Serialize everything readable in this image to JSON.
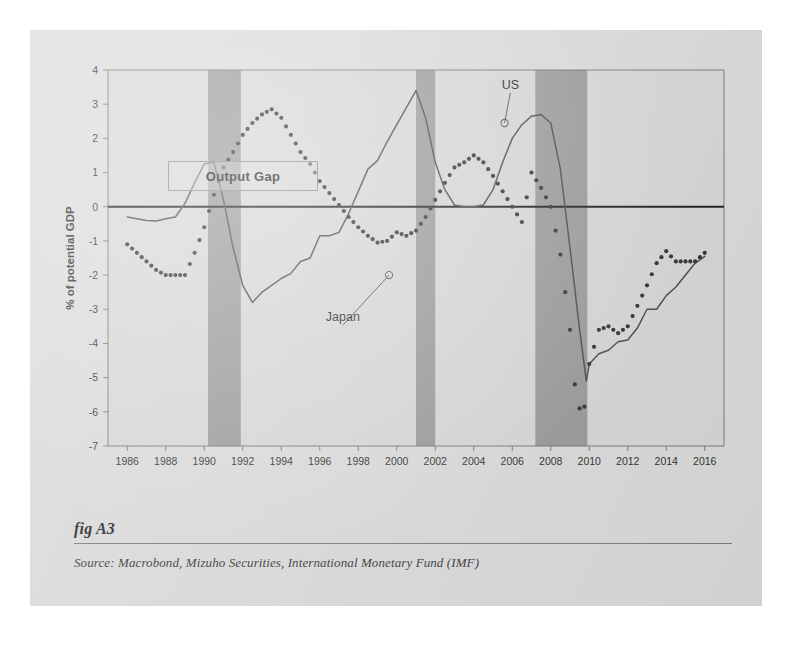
{
  "figure": {
    "label": "fig A3",
    "source": "Source:  Macrobond, Mizuho Securities, International Monetary Fund (IMF)"
  },
  "colors": {
    "page_background": "#ffffff",
    "card_background": "#dcdcdc",
    "plot_background": "#d8d8d8",
    "recession_band": "#9a9a9a",
    "series_line": "#4a4a4a",
    "zero_line": "#1a1a1a",
    "axis": "#6f6f6f",
    "text": "#2a2a2a"
  },
  "chart_data": {
    "type": "line",
    "title": "Output Gap",
    "xlabel": "",
    "ylabel": "% of potential GDP",
    "xlim": [
      1985,
      2017
    ],
    "ylim": [
      -7,
      4
    ],
    "yticks": [
      4,
      3,
      2,
      1,
      0,
      -1,
      -2,
      -3,
      -4,
      -5,
      -6,
      -7
    ],
    "ytick_labels": [
      "4",
      "3",
      "2",
      "1",
      "0",
      "-1",
      "-2",
      "-3",
      "-4",
      "-5",
      "-6",
      "-7"
    ],
    "xticks": [
      1986,
      1988,
      1990,
      1992,
      1994,
      1996,
      1998,
      2000,
      2002,
      2004,
      2006,
      2008,
      2010,
      2012,
      2014,
      2016
    ],
    "xtick_labels": [
      "1986",
      "1988",
      "1990",
      "1992",
      "1994",
      "1996",
      "1998",
      "2000",
      "2002",
      "2004",
      "2006",
      "2008",
      "2010",
      "2012",
      "2014",
      "2016"
    ],
    "grid": false,
    "zero_line": 0,
    "legend_position": "inline-annotations",
    "shaded_regions": [
      {
        "name": "recession-band-1990",
        "start": 1990.2,
        "end": 1991.9
      },
      {
        "name": "recession-band-2001",
        "start": 2001.0,
        "end": 2002.0
      },
      {
        "name": "recession-band-2008",
        "start": 2007.2,
        "end": 2009.9
      }
    ],
    "annotations": [
      {
        "name": "US",
        "text": "US",
        "series": "US",
        "point_x": 2005.6,
        "point_y": 2.45,
        "label_x": 2005.9,
        "label_y": 3.45
      },
      {
        "name": "Japan",
        "text": "Japan",
        "series": "Japan",
        "point_x": 1999.6,
        "point_y": -2.0,
        "label_x": 1997.2,
        "label_y": -3.35
      }
    ],
    "x": [
      1986,
      1986.5,
      1987,
      1987.5,
      1988,
      1988.5,
      1989,
      1989.5,
      1990,
      1990.5,
      1991,
      1991.5,
      1992,
      1992.5,
      1993,
      1993.5,
      1994,
      1994.5,
      1995,
      1995.5,
      1996,
      1996.5,
      1997,
      1997.5,
      1998,
      1998.5,
      1999,
      1999.5,
      2000,
      2000.5,
      2001,
      2001.5,
      2002,
      2002.5,
      2003,
      2003.5,
      2004,
      2004.5,
      2005,
      2005.5,
      2006,
      2006.5,
      2007,
      2007.5,
      2008,
      2008.5,
      2009,
      2009.5,
      2010,
      2010.5,
      2011,
      2011.5,
      2012,
      2012.5,
      2013,
      2013.5,
      2014,
      2014.5,
      2015,
      2015.5,
      2016
    ],
    "series": [
      {
        "name": "US",
        "style": "solid",
        "values": [
          -0.3,
          -0.35,
          -0.4,
          -0.42,
          -0.35,
          -0.3,
          0.1,
          0.7,
          1.25,
          1.3,
          0.2,
          -1.2,
          -2.3,
          -2.8,
          -2.5,
          -2.3,
          -2.1,
          -1.95,
          -1.6,
          -1.5,
          -0.85,
          -0.85,
          -0.75,
          -0.2,
          0.45,
          1.1,
          1.35,
          1.9,
          2.4,
          2.9,
          3.4,
          2.6,
          1.3,
          0.5,
          0.05,
          0.0,
          0.0,
          0.05,
          0.5,
          1.3,
          2.0,
          2.4,
          2.65,
          2.7,
          2.5,
          1.2,
          -1.0,
          -3.3,
          -4.9,
          -4.55,
          -4.2,
          -4.0,
          -3.8,
          -3.55,
          -3.05,
          -2.95,
          -2.6,
          -2.5,
          -2.0,
          -1.7,
          -1.45
        ]
      },
      {
        "name": "Japan",
        "style": "dotted",
        "values": [
          -1.1,
          -1.35,
          -1.6,
          -1.85,
          -2.0,
          -2.0,
          -2.0,
          -1.35,
          -0.6,
          0.35,
          1.15,
          1.6,
          2.1,
          2.45,
          2.7,
          2.85,
          2.6,
          2.1,
          1.6,
          1.25,
          0.75,
          0.4,
          0.05,
          -0.3,
          -0.6,
          -0.85,
          -1.05,
          -1.0,
          -0.75,
          -0.85,
          -0.7,
          -0.3,
          0.2,
          0.7,
          1.15,
          1.3,
          1.5,
          1.3,
          0.9,
          0.45,
          0.0,
          -0.45,
          -0.9,
          -1.35,
          -1.65,
          -1.9,
          -2.0,
          -1.95,
          -1.7,
          -1.5,
          -1.35,
          -1.3,
          -1.2,
          -1.35,
          -1.5,
          -1.55,
          -1.6,
          -1.35,
          -1.05,
          -0.8,
          -0.55
        ]
      }
    ],
    "japan_segment_late": {
      "name": "Japan late cycle",
      "note": "2007-2016 collapse and partial recovery",
      "x": [
        2007,
        2007.5,
        2008,
        2008.5,
        2009,
        2009.25,
        2009.5,
        2009.75,
        2010,
        2010.5,
        2011,
        2011.5,
        2012,
        2012.5,
        2013,
        2013.5,
        2014,
        2014.5,
        2015,
        2015.5,
        2016
      ],
      "values": [
        1.0,
        0.55,
        0.0,
        -1.4,
        -3.6,
        -5.2,
        -5.9,
        -5.85,
        -4.6,
        -3.6,
        -3.5,
        -3.7,
        -3.5,
        -2.9,
        -2.3,
        -1.65,
        -1.3,
        -1.6,
        -1.6,
        -1.6,
        -1.35
      ]
    },
    "us_segment_late": {
      "name": "US late cycle",
      "note": "2007-2016 collapse and partial recovery",
      "x": [
        2007,
        2007.5,
        2008,
        2008.5,
        2009,
        2009.5,
        2009.85,
        2010,
        2010.5,
        2011,
        2011.5,
        2012,
        2012.5,
        2013,
        2013.5,
        2014,
        2014.5,
        2015,
        2015.5,
        2016
      ],
      "values": [
        2.65,
        2.7,
        2.45,
        1.1,
        -1.2,
        -3.6,
        -5.1,
        -4.6,
        -4.3,
        -4.2,
        -3.95,
        -3.9,
        -3.55,
        -3.0,
        -3.0,
        -2.6,
        -2.35,
        -2.0,
        -1.65,
        -1.45
      ]
    }
  }
}
